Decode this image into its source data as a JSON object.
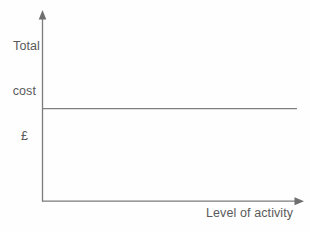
{
  "chart_data": {
    "type": "line",
    "title": "",
    "subtitle": "",
    "ylabel": "Total cost £",
    "ylabel_lines": [
      "Total",
      "cost",
      "£"
    ],
    "xlabel": "Level of activity",
    "xticklabels": [],
    "yticklabels": [],
    "grid": false,
    "legend": null,
    "legend_position": "none",
    "xlim": [
      0,
      100
    ],
    "ylim": [
      0,
      100
    ],
    "annotations": [],
    "series": [
      {
        "name": "Fixed cost",
        "x": [
          0,
          100
        ],
        "values": [
          50,
          50
        ],
        "color": "#808080",
        "style": "solid",
        "width": 1
      }
    ]
  },
  "figure": {
    "background_color": "#fefefe",
    "axis_color": "#7b7b7b",
    "text_color": "#5a5a5a",
    "line_color": "#808080",
    "x_axis_has_arrow": true,
    "y_axis_has_arrow": true
  },
  "labels": {
    "y_axis": {
      "line1": "Total",
      "line2": "cost",
      "line3": "£"
    },
    "x_axis": "Level of activity"
  }
}
